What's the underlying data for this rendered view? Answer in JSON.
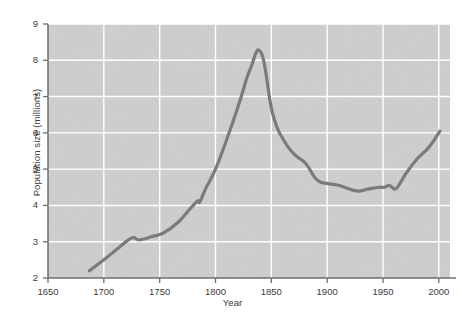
{
  "chart_data": {
    "type": "line",
    "title": "",
    "subtitle": "",
    "xlabel": "Year",
    "ylabel": "Population size (millions)",
    "xlim": [
      1650,
      2010
    ],
    "ylim": [
      2,
      9
    ],
    "xticks": [
      1650,
      1700,
      1750,
      1800,
      1850,
      1900,
      1950,
      2000
    ],
    "xtick_labels": [
      "1650",
      "1700",
      "1750",
      "1800",
      "1850",
      "1900",
      "1950",
      "2000"
    ],
    "yticks": [
      2,
      3,
      4,
      5,
      6,
      7,
      8,
      9
    ],
    "ytick_labels": [
      "2",
      "3",
      "4",
      "5",
      "6",
      "7",
      "8",
      "9"
    ],
    "grid": true,
    "grid_color": "#ffffff",
    "plot_bg_color": "#cdcdcd",
    "figure_bg_color": "#ffffff",
    "line_color": "#7b7b7b",
    "line_width": 3.2,
    "axis_color": "#6e6e6e",
    "text_color": "#3a3a3a",
    "legend": null,
    "series": [
      {
        "name": "Population size",
        "x": [
          1687,
          1700,
          1712,
          1725,
          1732,
          1744,
          1754,
          1767,
          1777,
          1784,
          1786,
          1791,
          1800,
          1811,
          1821,
          1831,
          1841,
          1851,
          1861,
          1871,
          1881,
          1891,
          1901,
          1911,
          1926,
          1936,
          1946,
          1951,
          1956,
          1961,
          1966,
          1971,
          1981,
          1991,
          2001
        ],
        "y": [
          2.2,
          2.5,
          2.8,
          3.1,
          3.05,
          3.15,
          3.25,
          3.55,
          3.9,
          4.12,
          4.1,
          4.45,
          5.0,
          5.9,
          6.8,
          7.75,
          8.2,
          6.55,
          5.8,
          5.4,
          5.15,
          4.7,
          4.6,
          4.55,
          4.4,
          4.45,
          4.5,
          4.5,
          4.55,
          4.45,
          4.65,
          4.9,
          5.3,
          5.6,
          6.05
        ]
      }
    ]
  },
  "geometry": {
    "plot_left": 48,
    "plot_right": 450,
    "plot_top": 24,
    "plot_bottom": 278
  }
}
